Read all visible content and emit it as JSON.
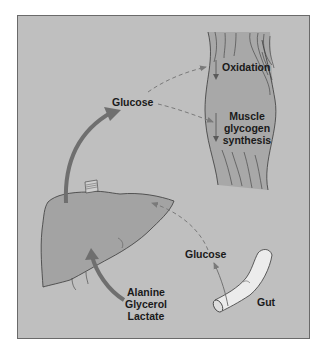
{
  "diagram": {
    "type": "physiology-flow",
    "colors": {
      "background": "#bfbfbf",
      "liver": "#a3a3a3",
      "muscle": "#a8a8a8",
      "gut": "#ececec",
      "solid_arrow": "#6f6f6f",
      "dashed_arrow": "#7a7a7a",
      "outline": "#3a3a3a"
    },
    "organs": [
      "Liver",
      "Muscle",
      "Gut"
    ],
    "labels": {
      "glucose_top": "Glucose",
      "oxidation": "Oxidation",
      "muscle_glycogen_1": "Muscle",
      "muscle_glycogen_2": "glycogen",
      "muscle_glycogen_3": "synthesis",
      "glucose_gut": "Glucose",
      "gut": "Gut",
      "precursor_1": "Alanine",
      "precursor_2": "Glycerol",
      "precursor_3": "Lactate"
    },
    "flows": [
      {
        "from": "Liver",
        "to": "Glucose",
        "style": "solid-thick"
      },
      {
        "from": "Glucose",
        "to": "Oxidation",
        "style": "dashed"
      },
      {
        "from": "Glucose",
        "to": "Muscle glycogen synthesis",
        "style": "dashed"
      },
      {
        "from": "Gut",
        "to": "Glucose",
        "style": "thin"
      },
      {
        "from": "Glucose",
        "to": "Liver",
        "style": "dashed"
      },
      {
        "from": "Alanine/Glycerol/Lactate",
        "to": "Liver",
        "style": "solid-thick"
      }
    ]
  }
}
